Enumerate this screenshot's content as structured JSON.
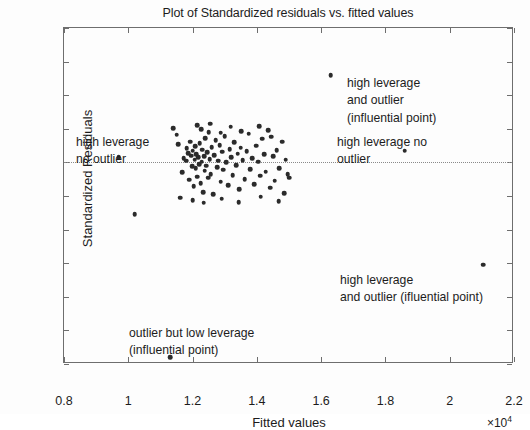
{
  "chart_data": {
    "type": "scatter",
    "title": "Plot of Standardized residuals vs. fitted values",
    "xlabel": "Fitted values",
    "ylabel": "Standardized Residuals",
    "x_multiplier": "×10",
    "x_multiplier_exp": "4",
    "xlim": [
      8000,
      22000
    ],
    "ylim": [
      -6,
      4
    ],
    "xticks": [
      0.8,
      1,
      1.2,
      1.4,
      1.6,
      1.8,
      2,
      2.2
    ],
    "xtick_labels": [
      "0.8",
      "1",
      "1.2",
      "1.4",
      "1.6",
      "1.8",
      "2",
      "2.2"
    ],
    "yticks": [
      4,
      3,
      2,
      1,
      0,
      -1,
      -2,
      -3,
      -4,
      -5,
      -6
    ],
    "ytick_labels": [
      "4",
      "3",
      "2",
      "1",
      "0",
      "−1",
      "−2",
      "−3",
      "−4",
      "−5",
      "−6"
    ],
    "grid": false,
    "reference_line_y": 0,
    "marker_color": "#2b2b2b",
    "frame_color": "#6e6e6e",
    "points": [
      [
        11550,
        0.55
      ],
      [
        11680,
        -0.3
      ],
      [
        11720,
        0.12
      ],
      [
        11800,
        0.05
      ],
      [
        11820,
        0.42
      ],
      [
        11860,
        0.28
      ],
      [
        11900,
        -0.52
      ],
      [
        11930,
        0.62
      ],
      [
        11960,
        0.2
      ],
      [
        11980,
        -0.12
      ],
      [
        12000,
        0.35
      ],
      [
        12030,
        -0.7
      ],
      [
        12060,
        0.08
      ],
      [
        12080,
        0.48
      ],
      [
        12100,
        -0.18
      ],
      [
        12120,
        0.25
      ],
      [
        12150,
        -0.42
      ],
      [
        12180,
        0.15
      ],
      [
        12200,
        -0.05
      ],
      [
        12220,
        0.58
      ],
      [
        12250,
        -0.62
      ],
      [
        12280,
        0.02
      ],
      [
        12300,
        0.38
      ],
      [
        12330,
        -0.88
      ],
      [
        12360,
        0.18
      ],
      [
        12380,
        -0.25
      ],
      [
        12400,
        0.72
      ],
      [
        12430,
        -0.1
      ],
      [
        12460,
        0.3
      ],
      [
        12480,
        -0.45
      ],
      [
        12500,
        0.9
      ],
      [
        12530,
        0.1
      ],
      [
        12560,
        -0.35
      ],
      [
        12600,
        0.45
      ],
      [
        12640,
        -0.95
      ],
      [
        12680,
        0.22
      ],
      [
        12720,
        0.66
      ],
      [
        12760,
        -0.15
      ],
      [
        12800,
        0.05
      ],
      [
        12840,
        0.52
      ],
      [
        12880,
        -0.58
      ],
      [
        12920,
        0.32
      ],
      [
        12960,
        -0.22
      ],
      [
        13000,
        0.78
      ],
      [
        13050,
        0.0
      ],
      [
        13100,
        -0.68
      ],
      [
        13150,
        0.4
      ],
      [
        13200,
        0.16
      ],
      [
        13250,
        -0.38
      ],
      [
        13300,
        0.6
      ],
      [
        13350,
        -0.08
      ],
      [
        13400,
        0.26
      ],
      [
        13450,
        -0.8
      ],
      [
        13500,
        0.44
      ],
      [
        13560,
        0.06
      ],
      [
        13620,
        -0.5
      ],
      [
        13680,
        0.34
      ],
      [
        13740,
        0.86
      ],
      [
        13800,
        -0.2
      ],
      [
        13860,
        0.12
      ],
      [
        13920,
        -0.65
      ],
      [
        13980,
        0.5
      ],
      [
        14040,
        0.02
      ],
      [
        14100,
        -0.4
      ],
      [
        14160,
        0.7
      ],
      [
        14220,
        0.24
      ],
      [
        14280,
        -0.28
      ],
      [
        14350,
        0.95
      ],
      [
        14420,
        -0.75
      ],
      [
        14500,
        0.18
      ],
      [
        14560,
        -0.55
      ],
      [
        14620,
        0.36
      ],
      [
        14700,
        -0.18
      ],
      [
        14780,
        0.62
      ],
      [
        14850,
        -0.92
      ],
      [
        14900,
        0.08
      ],
      [
        14960,
        -0.35
      ],
      [
        11400,
        1.02
      ],
      [
        11500,
        0.82
      ],
      [
        12140,
        1.1
      ],
      [
        12270,
        0.98
      ],
      [
        12550,
        1.15
      ],
      [
        12880,
        0.88
      ],
      [
        13180,
        1.06
      ],
      [
        13520,
        0.92
      ],
      [
        14080,
        1.08
      ],
      [
        14450,
        0.76
      ],
      [
        11620,
        -1.05
      ],
      [
        12010,
        -1.12
      ],
      [
        12340,
        -1.2
      ],
      [
        12900,
        -1.08
      ],
      [
        13440,
        -1.18
      ],
      [
        14120,
        -1.02
      ],
      [
        14680,
        -1.15
      ],
      [
        15000,
        -0.45
      ],
      [
        9700,
        0.15
      ],
      [
        10200,
        -1.55
      ],
      [
        11300,
        -5.8
      ],
      [
        16300,
        2.6
      ],
      [
        18600,
        0.35
      ],
      [
        21050,
        -3.05
      ]
    ],
    "annotations": [
      {
        "id": "hl-outlier",
        "lines": [
          "high leverage",
          "and outlier",
          "(influential point)"
        ],
        "describes_point": [
          16300,
          2.6
        ]
      },
      {
        "id": "hl-no-outlier-right",
        "lines": [
          "high leverage no",
          "outlier"
        ],
        "describes_point": [
          18600,
          0.35
        ]
      },
      {
        "id": "hl-no-outlier-left",
        "lines": [
          "high leverage",
          "no outlier"
        ],
        "describes_point": [
          9700,
          0.15
        ]
      },
      {
        "id": "hl-outlier-low",
        "lines": [
          "high leverage",
          "and outlier (ifluential point)"
        ],
        "describes_point": [
          21050,
          -3.05
        ]
      },
      {
        "id": "outlier-low-leverage",
        "lines": [
          "outlier but low leverage",
          "(influential point)"
        ],
        "describes_point": [
          11300,
          -5.8
        ]
      }
    ]
  }
}
